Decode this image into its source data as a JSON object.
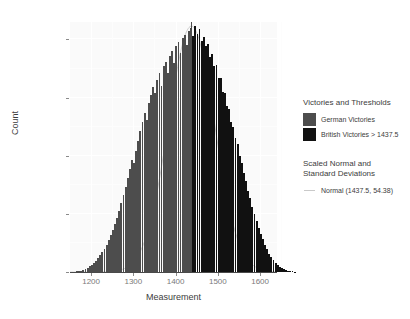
{
  "chart_data": {
    "type": "bar",
    "title": "",
    "xlabel": "Measurement",
    "ylabel": "Count",
    "xlim": [
      1150,
      1640
    ],
    "ylim": [
      0,
      4300
    ],
    "xticks": [
      1200,
      1300,
      1400,
      1500,
      1600
    ],
    "xticklabels": [
      "1200",
      "1300",
      "1400",
      "1500",
      "1600"
    ],
    "yticks": [
      0,
      1000,
      2000,
      3000,
      4000
    ],
    "yticklabels": [
      "0",
      "1000",
      "2000",
      "3000",
      "4000"
    ],
    "grid": true,
    "legend_position": "right",
    "bin_width": 5,
    "threshold": 1437.5,
    "normal_mean": 1437.5,
    "normal_sd": 54.38,
    "series": [
      {
        "name": "German Victories",
        "color": "#4d4d4d",
        "condition": "measurement <= 1437.5"
      },
      {
        "name": "British Victories > 1437.5",
        "color": "#111111",
        "condition": "measurement > 1437.5"
      },
      {
        "name": "Normal (1437.5, 54.38)",
        "color": "#c9c9c9",
        "type": "line"
      }
    ],
    "bins": [
      {
        "x": 1157,
        "y": 5
      },
      {
        "x": 1162,
        "y": 8
      },
      {
        "x": 1167,
        "y": 12
      },
      {
        "x": 1172,
        "y": 18
      },
      {
        "x": 1177,
        "y": 26
      },
      {
        "x": 1182,
        "y": 38
      },
      {
        "x": 1187,
        "y": 55
      },
      {
        "x": 1192,
        "y": 75
      },
      {
        "x": 1197,
        "y": 100
      },
      {
        "x": 1202,
        "y": 128
      },
      {
        "x": 1207,
        "y": 160
      },
      {
        "x": 1212,
        "y": 195
      },
      {
        "x": 1217,
        "y": 235
      },
      {
        "x": 1222,
        "y": 285
      },
      {
        "x": 1227,
        "y": 340
      },
      {
        "x": 1232,
        "y": 400
      },
      {
        "x": 1237,
        "y": 470
      },
      {
        "x": 1242,
        "y": 545
      },
      {
        "x": 1247,
        "y": 630
      },
      {
        "x": 1252,
        "y": 720
      },
      {
        "x": 1257,
        "y": 820
      },
      {
        "x": 1262,
        "y": 930
      },
      {
        "x": 1267,
        "y": 1050
      },
      {
        "x": 1272,
        "y": 1180
      },
      {
        "x": 1277,
        "y": 1320
      },
      {
        "x": 1282,
        "y": 1460
      },
      {
        "x": 1287,
        "y": 1610
      },
      {
        "x": 1292,
        "y": 1770
      },
      {
        "x": 1297,
        "y": 1930
      },
      {
        "x": 1302,
        "y": 1880
      },
      {
        "x": 1307,
        "y": 2090
      },
      {
        "x": 1312,
        "y": 2250
      },
      {
        "x": 1317,
        "y": 2420
      },
      {
        "x": 1322,
        "y": 2580
      },
      {
        "x": 1327,
        "y": 2740
      },
      {
        "x": 1332,
        "y": 2620
      },
      {
        "x": 1337,
        "y": 2900
      },
      {
        "x": 1342,
        "y": 3050
      },
      {
        "x": 1347,
        "y": 3180
      },
      {
        "x": 1352,
        "y": 3080
      },
      {
        "x": 1357,
        "y": 3300
      },
      {
        "x": 1362,
        "y": 3420
      },
      {
        "x": 1367,
        "y": 3200
      },
      {
        "x": 1372,
        "y": 3540
      },
      {
        "x": 1377,
        "y": 3620
      },
      {
        "x": 1382,
        "y": 3420
      },
      {
        "x": 1387,
        "y": 3720
      },
      {
        "x": 1392,
        "y": 3800
      },
      {
        "x": 1397,
        "y": 3600
      },
      {
        "x": 1402,
        "y": 3880
      },
      {
        "x": 1407,
        "y": 3950
      },
      {
        "x": 1412,
        "y": 3760
      },
      {
        "x": 1417,
        "y": 4020
      },
      {
        "x": 1422,
        "y": 4080
      },
      {
        "x": 1427,
        "y": 3900
      },
      {
        "x": 1432,
        "y": 4150
      },
      {
        "x": 1437,
        "y": 4200
      },
      {
        "x": 1442,
        "y": 4060
      },
      {
        "x": 1447,
        "y": 4230
      },
      {
        "x": 1452,
        "y": 4100
      },
      {
        "x": 1457,
        "y": 4180
      },
      {
        "x": 1462,
        "y": 3980
      },
      {
        "x": 1467,
        "y": 4050
      },
      {
        "x": 1472,
        "y": 3880
      },
      {
        "x": 1477,
        "y": 3920
      },
      {
        "x": 1482,
        "y": 3700
      },
      {
        "x": 1487,
        "y": 3750
      },
      {
        "x": 1492,
        "y": 3540
      },
      {
        "x": 1497,
        "y": 3560
      },
      {
        "x": 1502,
        "y": 3340
      },
      {
        "x": 1507,
        "y": 3340
      },
      {
        "x": 1512,
        "y": 3100
      },
      {
        "x": 1517,
        "y": 3080
      },
      {
        "x": 1522,
        "y": 2850
      },
      {
        "x": 1527,
        "y": 2800
      },
      {
        "x": 1532,
        "y": 2580
      },
      {
        "x": 1537,
        "y": 2500
      },
      {
        "x": 1542,
        "y": 2300
      },
      {
        "x": 1547,
        "y": 2200
      },
      {
        "x": 1552,
        "y": 2000
      },
      {
        "x": 1557,
        "y": 1880
      },
      {
        "x": 1562,
        "y": 1700
      },
      {
        "x": 1567,
        "y": 1570
      },
      {
        "x": 1572,
        "y": 1400
      },
      {
        "x": 1577,
        "y": 1270
      },
      {
        "x": 1582,
        "y": 1120
      },
      {
        "x": 1587,
        "y": 1000
      },
      {
        "x": 1592,
        "y": 870
      },
      {
        "x": 1597,
        "y": 760
      },
      {
        "x": 1602,
        "y": 650
      },
      {
        "x": 1607,
        "y": 560
      },
      {
        "x": 1612,
        "y": 465
      },
      {
        "x": 1617,
        "y": 390
      },
      {
        "x": 1622,
        "y": 315
      },
      {
        "x": 1627,
        "y": 255
      },
      {
        "x": 1632,
        "y": 200
      },
      {
        "x": 1637,
        "y": 160
      },
      {
        "x": 1642,
        "y": 120
      },
      {
        "x": 1647,
        "y": 90
      },
      {
        "x": 1652,
        "y": 68
      },
      {
        "x": 1657,
        "y": 48
      },
      {
        "x": 1662,
        "y": 34
      },
      {
        "x": 1667,
        "y": 24
      },
      {
        "x": 1672,
        "y": 16
      },
      {
        "x": 1677,
        "y": 10
      },
      {
        "x": 1682,
        "y": 6
      }
    ]
  },
  "legend": {
    "block1_title": "Victories and Thresholds",
    "items": [
      {
        "label": "German Victories",
        "color": "#4d4d4d"
      },
      {
        "label": "British Victories > 1437.5",
        "color": "#111111"
      }
    ],
    "block2_title_line1": "Scaled Normal and",
    "block2_title_line2": "Standard Deviations",
    "line_items": [
      {
        "label": "Normal (1437.5, 54.38)",
        "color": "#c9c9c9"
      }
    ]
  }
}
